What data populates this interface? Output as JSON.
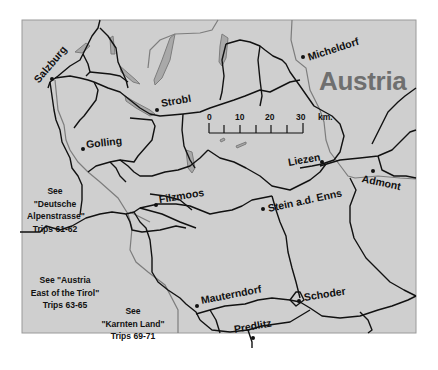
{
  "map": {
    "country_label": "Austria",
    "colors": {
      "land": "#cfcfcf",
      "roads": "#111111",
      "rivers": "#7d7d7d",
      "lakes": "#a9a9a9",
      "country_label": "#6f6f6f",
      "page_background": "#ffffff"
    },
    "towns": [
      {
        "name": "Salzburg"
      },
      {
        "name": "Strobl"
      },
      {
        "name": "Golling"
      },
      {
        "name": "Micheldorf"
      },
      {
        "name": "Liezen"
      },
      {
        "name": "Admont"
      },
      {
        "name": "Filzmoos"
      },
      {
        "name": "Stein a.d. Enns"
      },
      {
        "name": "Mauterndorf"
      },
      {
        "name": "Schoder"
      },
      {
        "name": "Predlitz"
      }
    ],
    "scale_bar": {
      "ticks": [
        "0",
        "10",
        "20",
        "30"
      ],
      "unit": "km."
    },
    "cross_references": [
      {
        "line1": "See",
        "line2": "\"Deutsche",
        "line3": "Alpenstrasse\"",
        "line4": "Trips 61-62"
      },
      {
        "line1": "See \"Austria",
        "line2": "East of the Tirol\"",
        "line3": "Trips 63-65"
      },
      {
        "line1": "See",
        "line2": "\"Karnten Land\"",
        "line3": "Trips 69-71"
      }
    ]
  }
}
